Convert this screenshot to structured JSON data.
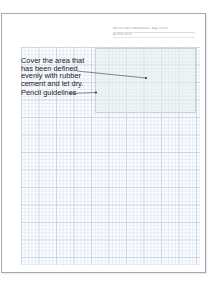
{
  "page": {
    "header": {
      "title_line": "Still Life with a Writing Desk · Page 4 of 11",
      "author_line": "By Peter Stern"
    }
  },
  "annotations": [
    {
      "text": "Cover the area that has been defined evenly with rubber cement and let dry.",
      "target": "defined-area"
    },
    {
      "text": "Pencil guidelines",
      "target": "defined-area-edge"
    }
  ],
  "colors": {
    "grid_line": "#c8d4e4",
    "defined_area_fill": "#e1f0eb",
    "defined_area_border": "#c9d6d0",
    "page_border": "#a8a8a8",
    "text": "#1a1a1a"
  }
}
